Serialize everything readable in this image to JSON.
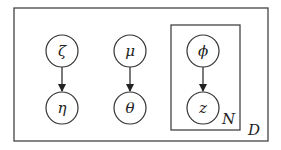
{
  "diagram": {
    "type": "plate-notation",
    "colors": {
      "stroke": "#333333",
      "background": "#ffffff"
    },
    "plates": [
      {
        "id": "outer",
        "label": "D",
        "x": 14,
        "y": 8,
        "w": 254,
        "h": 133
      },
      {
        "id": "inner",
        "label": "N",
        "x": 171,
        "y": 25,
        "w": 69,
        "h": 105
      }
    ],
    "nodes": [
      {
        "id": "zeta",
        "label": "ζ",
        "cx": 62,
        "cy": 51
      },
      {
        "id": "eta",
        "label": "η",
        "cx": 62,
        "cy": 108
      },
      {
        "id": "mu",
        "label": "μ",
        "cx": 130,
        "cy": 51
      },
      {
        "id": "theta",
        "label": "θ",
        "cx": 130,
        "cy": 108
      },
      {
        "id": "phi",
        "label": "ϕ",
        "cx": 203,
        "cy": 51
      },
      {
        "id": "z",
        "label": "z",
        "cx": 203,
        "cy": 108
      }
    ],
    "edges": [
      {
        "from": "zeta",
        "to": "eta"
      },
      {
        "from": "mu",
        "to": "theta"
      },
      {
        "from": "phi",
        "to": "z"
      }
    ]
  }
}
